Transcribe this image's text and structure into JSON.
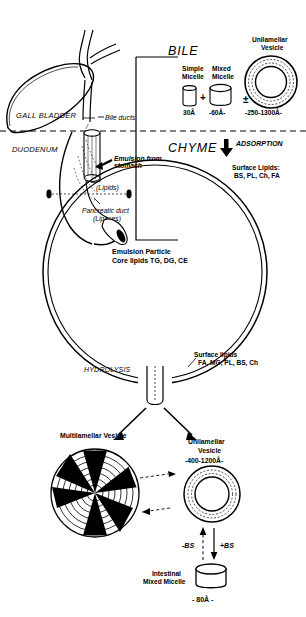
{
  "figure": {
    "title_absent": true,
    "sections": {
      "bile": {
        "label": "BILE"
      },
      "chyme": {
        "label": "CHYME"
      }
    }
  },
  "anatomy": {
    "gall_bladder": "GALL BLADDER",
    "bile_ducts": "Bile ducts",
    "duodenum": "DUODENUM",
    "emulsion_from_stomach": "Emulsion from\nstomach",
    "emulsion_line1": "Emulsion from",
    "emulsion_line2": "stomach",
    "lipids": "(Lipids)",
    "pancreatic_duct_line1": "Pancreatic duct",
    "pancreatic_duct_line2": "(Lipases)"
  },
  "bile_particles": {
    "simple_micelle_line1": "Simple",
    "simple_micelle_line2": "Micelle",
    "simple_micelle_size": "30Å",
    "plus_sign": "+",
    "mixed_micelle_line1": "Mixed",
    "mixed_micelle_line2": "Micelle",
    "mixed_micelle_size": "-60Å-",
    "plusminus_sign": "±",
    "unilamellar_line1": "Unilamellar",
    "unilamellar_line2": "Vesicle",
    "unilamellar_size": "-250-1300Å-"
  },
  "chyme_particles": {
    "adsorption": "ADSORPTION",
    "surface_lipids_label": "Surface Lipids:",
    "surface_lipids_values": "BS, PL, Ch, FA",
    "emulsion_particle_label": "Emulsion Particle",
    "core_lipids": "Core lipids  TG, DG, CE",
    "hydrolysis": "HYDROLYSIS",
    "post_surface_lipids_label": "Surface lipids",
    "post_surface_lipids_values": "FA, MG, PL, BS, Ch"
  },
  "products": {
    "multilamellar_label": "Multilamellar Vesicle",
    "unilamellar_line1": "Unilamellar",
    "unilamellar_line2": "Vesicle",
    "unilamellar_size": "-400-1200Å-",
    "minus_bs": "-BS",
    "plus_bs": "+BS",
    "intestinal_line1": "Intestinal",
    "intestinal_line2": "Mixed Micelle",
    "intestinal_size": "- 80Å -"
  },
  "colors": {
    "ink": "#000000",
    "background": "#ffffff",
    "fill": "#000000"
  }
}
